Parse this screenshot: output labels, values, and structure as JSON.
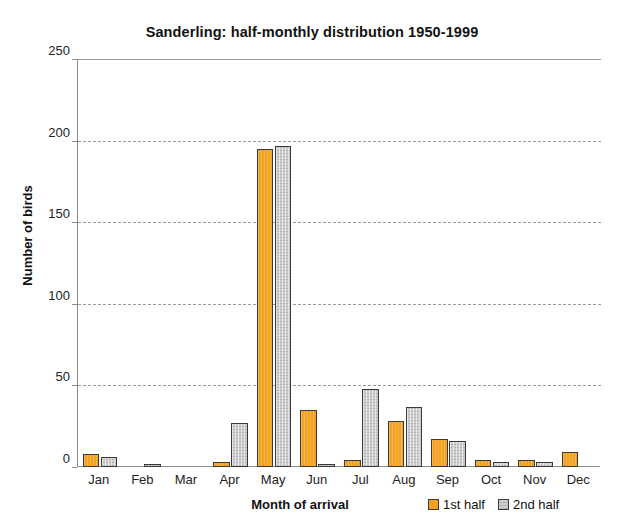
{
  "chart_data": {
    "type": "bar",
    "title": "Sanderling: half-monthly distribution 1950-1999",
    "xlabel": "Month of arrival",
    "ylabel": "Number of birds",
    "categories": [
      "Jan",
      "Feb",
      "Mar",
      "Apr",
      "May",
      "Jun",
      "Jul",
      "Aug",
      "Sep",
      "Oct",
      "Nov",
      "Dec"
    ],
    "series": [
      {
        "name": "1st half",
        "color": "#f2a121",
        "values": [
          8,
          0,
          0,
          3,
          195,
          35,
          4,
          28,
          17,
          4,
          4,
          9
        ]
      },
      {
        "name": "2nd half",
        "color": "#cccccc",
        "values": [
          6,
          1,
          0,
          27,
          197,
          2,
          48,
          37,
          16,
          3,
          3,
          0
        ]
      }
    ],
    "ylim": [
      0,
      250
    ],
    "yticks": [
      0,
      50,
      100,
      150,
      200,
      250
    ],
    "ytick_labels": [
      "0",
      "50",
      "100",
      "150",
      "200",
      "250"
    ],
    "grid": "horizontal-dashed",
    "legend_position": "bottom-right",
    "legend_entries": [
      "1st half",
      "2nd half"
    ]
  }
}
